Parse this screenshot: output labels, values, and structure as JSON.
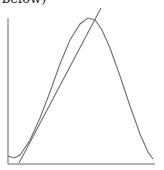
{
  "caption": {
    "text": "below)"
  },
  "colors": {
    "axis": "#9a9a9a",
    "curve": "#6e6e6e",
    "line": "#6e6e6e"
  },
  "chart_data": {
    "type": "line",
    "title": "",
    "xlabel": "",
    "ylabel": "",
    "grid": false,
    "legend": null,
    "series": [
      {
        "name": "bell-curve",
        "description": "unimodal right-skewed density-like curve starting near baseline, peaking then decaying to baseline",
        "points_px": [
          [
            8,
            156
          ],
          [
            14,
            158
          ],
          [
            20,
            155
          ],
          [
            30,
            140
          ],
          [
            40,
            118
          ],
          [
            50,
            92
          ],
          [
            60,
            64
          ],
          [
            70,
            40
          ],
          [
            80,
            24
          ],
          [
            88,
            18
          ],
          [
            95,
            20
          ],
          [
            102,
            30
          ],
          [
            110,
            48
          ],
          [
            120,
            76
          ],
          [
            130,
            106
          ],
          [
            140,
            134
          ],
          [
            148,
            152
          ],
          [
            153,
            159
          ]
        ]
      },
      {
        "name": "tangent-line",
        "description": "straight line tangent to the curve on its rising flank",
        "points_px": [
          [
            19,
            163
          ],
          [
            101,
            8
          ]
        ]
      }
    ],
    "axes": {
      "y_axis_px": {
        "x": 8,
        "y_top": 18,
        "y_bottom": 164
      },
      "x_axis_px": {
        "y": 164,
        "x_left": 8,
        "x_right": 155
      }
    }
  }
}
